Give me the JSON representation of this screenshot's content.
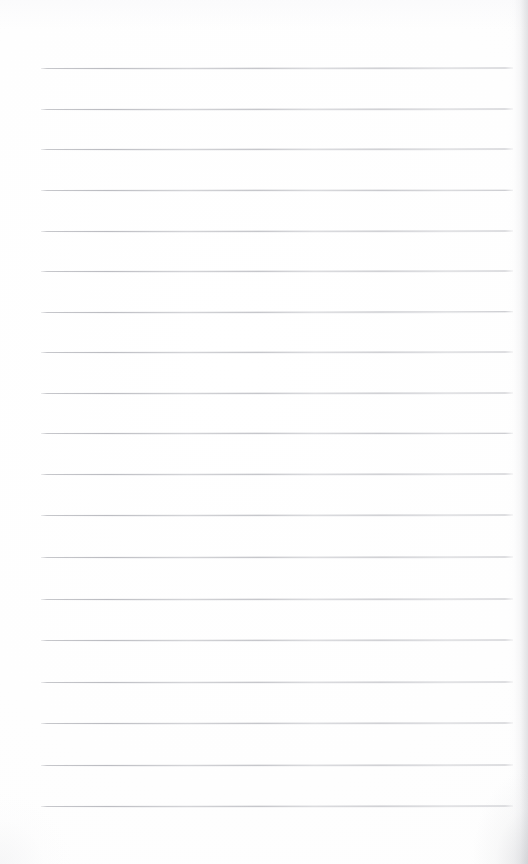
{
  "document": {
    "kind": "lined-notebook-paper-scan",
    "title": "",
    "page_label": "",
    "background_color": "#ffffff",
    "paper_tone": "#fdfdfd",
    "width_px": 528,
    "height_px": 864,
    "handwriting_text": "",
    "printed_text": "",
    "has_text_content": false,
    "has_margin_rule": false,
    "has_header": false,
    "has_footer": false,
    "has_holes": false
  },
  "ruling": {
    "line_color": "#c4c5c9",
    "line_ink_color": "#b2b3b9",
    "line_count": 19,
    "line_thickness_px": 1,
    "spacing_px": 41,
    "first_line_y": 68,
    "last_line_y": 806,
    "left_x": 41,
    "right_x": 513,
    "line_length_px": 472,
    "lines": [
      {
        "index": 1,
        "y": 68,
        "x1": 41,
        "x2": 513,
        "tilt_deg": -0.06
      },
      {
        "index": 2,
        "y": 109,
        "x1": 41,
        "x2": 513,
        "tilt_deg": -0.05
      },
      {
        "index": 3,
        "y": 149,
        "x1": 41,
        "x2": 513,
        "tilt_deg": -0.07
      },
      {
        "index": 4,
        "y": 190,
        "x1": 41,
        "x2": 513,
        "tilt_deg": -0.04
      },
      {
        "index": 5,
        "y": 231,
        "x1": 41,
        "x2": 513,
        "tilt_deg": -0.06
      },
      {
        "index": 6,
        "y": 271,
        "x1": 41,
        "x2": 513,
        "tilt_deg": -0.05
      },
      {
        "index": 7,
        "y": 312,
        "x1": 41,
        "x2": 513,
        "tilt_deg": -0.08
      },
      {
        "index": 8,
        "y": 352,
        "x1": 41,
        "x2": 513,
        "tilt_deg": -0.05
      },
      {
        "index": 9,
        "y": 393,
        "x1": 41,
        "x2": 513,
        "tilt_deg": -0.06
      },
      {
        "index": 10,
        "y": 433,
        "x1": 41,
        "x2": 513,
        "tilt_deg": -0.04
      },
      {
        "index": 11,
        "y": 474,
        "x1": 41,
        "x2": 513,
        "tilt_deg": -0.07
      },
      {
        "index": 12,
        "y": 515,
        "x1": 41,
        "x2": 513,
        "tilt_deg": -0.05
      },
      {
        "index": 13,
        "y": 557,
        "x1": 41,
        "x2": 513,
        "tilt_deg": -0.06
      },
      {
        "index": 14,
        "y": 599,
        "x1": 41,
        "x2": 513,
        "tilt_deg": -0.05
      },
      {
        "index": 15,
        "y": 640,
        "x1": 41,
        "x2": 513,
        "tilt_deg": -0.07
      },
      {
        "index": 16,
        "y": 682,
        "x1": 41,
        "x2": 513,
        "tilt_deg": -0.05
      },
      {
        "index": 17,
        "y": 723,
        "x1": 41,
        "x2": 513,
        "tilt_deg": -0.06
      },
      {
        "index": 18,
        "y": 765,
        "x1": 41,
        "x2": 513,
        "tilt_deg": -0.05
      },
      {
        "index": 19,
        "y": 806,
        "x1": 41,
        "x2": 513,
        "tilt_deg": -0.07
      }
    ]
  },
  "scan_artifacts": {
    "right_edge_shadow": true,
    "bottom_right_corner_shadow": true,
    "bottom_left_corner_shadow": true,
    "top_edge_light_falloff": true
  }
}
